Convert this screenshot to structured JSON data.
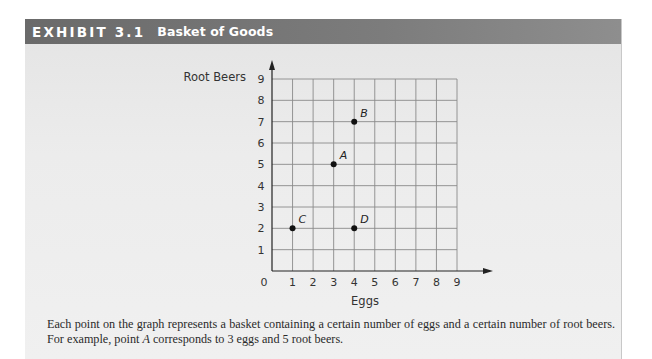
{
  "header": {
    "exhibit_label": "EXHIBIT 3.1",
    "title": "Basket of Goods"
  },
  "chart_data": {
    "type": "scatter",
    "title": "Basket of Goods",
    "xlabel": "Eggs",
    "ylabel": "Root Beers",
    "xlim": [
      0,
      9
    ],
    "ylim": [
      0,
      9
    ],
    "grid": true,
    "x_ticks": [
      "0",
      "1",
      "2",
      "3",
      "4",
      "5",
      "6",
      "7",
      "8",
      "9"
    ],
    "y_ticks": [
      "1",
      "2",
      "3",
      "4",
      "5",
      "6",
      "7",
      "8",
      "9"
    ],
    "points": [
      {
        "label": "A",
        "x": 3,
        "y": 5
      },
      {
        "label": "B",
        "x": 4,
        "y": 7
      },
      {
        "label": "C",
        "x": 1,
        "y": 2
      },
      {
        "label": "D",
        "x": 4,
        "y": 2
      }
    ]
  },
  "caption": {
    "line1": "Each point on the graph represents a basket containing a certain number of eggs and a certain number of root beers.",
    "line2_pre": "For example, point ",
    "line2_point": "A",
    "line2_post": " corresponds to 3 eggs and 5 root beers."
  },
  "colors": {
    "header_bg": "#747474",
    "panel_bg": "#ebebeb",
    "grid": "#8a8a8a",
    "axis": "#222222",
    "point": "#111111"
  }
}
